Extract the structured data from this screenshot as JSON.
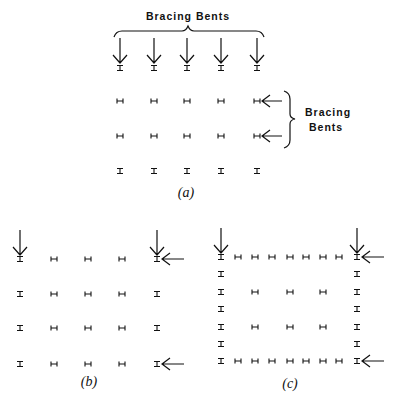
{
  "figure": {
    "colors": {
      "ink": "#111111",
      "background": "#ffffff"
    },
    "panel_a": {
      "label": "(a)",
      "top_annotation": "Bracing Bents",
      "side_annotation_line1": "Bracing",
      "side_annotation_line2": "Bents",
      "columns_x": [
        120,
        154,
        187,
        221,
        257
      ],
      "rows": [
        {
          "y": 68,
          "orientation": "I"
        },
        {
          "y": 101,
          "orientation": "H"
        },
        {
          "y": 136,
          "orientation": "H"
        },
        {
          "y": 171,
          "orientation": "I"
        }
      ],
      "down_arrows_columns": [
        0,
        1,
        2,
        3,
        4
      ],
      "left_arrows_rows": [
        1,
        2
      ]
    },
    "panel_b": {
      "label": "(b)",
      "columns_x": [
        20,
        54,
        88,
        122,
        157
      ],
      "rows_y": [
        259,
        294,
        328,
        364
      ],
      "grid": [
        [
          "I",
          "H",
          "H",
          "H",
          "I"
        ],
        [
          "I",
          "H",
          "H",
          "H",
          "I"
        ],
        [
          "I",
          "H",
          "H",
          "H",
          "I"
        ],
        [
          "I",
          "H",
          "H",
          "H",
          "I"
        ]
      ],
      "down_arrows_columns": [
        0,
        4
      ],
      "left_arrows_rows": [
        0,
        3
      ]
    },
    "panel_c": {
      "label": "(c)",
      "columns_x": [
        221,
        238,
        255,
        272,
        290,
        306,
        323,
        339,
        357
      ],
      "rows_y": [
        257,
        274,
        292,
        309,
        327,
        344,
        361
      ],
      "grid": [
        [
          "I",
          "H",
          "H",
          "H",
          "H",
          "H",
          "H",
          "H",
          "I"
        ],
        [
          "I",
          "",
          "",
          "",
          "",
          "",
          "",
          "",
          "I"
        ],
        [
          "I",
          "",
          "H",
          "",
          "H",
          "",
          "H",
          "",
          "I"
        ],
        [
          "I",
          "",
          "",
          "",
          "",
          "",
          "",
          "",
          "I"
        ],
        [
          "I",
          "",
          "H",
          "",
          "H",
          "",
          "H",
          "",
          "I"
        ],
        [
          "I",
          "",
          "",
          "",
          "",
          "",
          "",
          "",
          "I"
        ],
        [
          "I",
          "H",
          "H",
          "H",
          "H",
          "H",
          "H",
          "H",
          "I"
        ]
      ],
      "down_arrows_columns": [
        0,
        8
      ],
      "left_arrows_rows": [
        0,
        6
      ]
    }
  }
}
